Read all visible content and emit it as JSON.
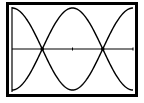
{
  "chart_data": {
    "type": "line",
    "title": "",
    "xlabel": "",
    "ylabel": "",
    "xlim": [
      0,
      6.2832
    ],
    "ylim": [
      -1,
      1
    ],
    "grid": false,
    "legend": null,
    "x": [
      0,
      0.7854,
      1.5708,
      2.3562,
      3.1416,
      3.927,
      4.7124,
      5.4978,
      6.2832
    ],
    "series": [
      {
        "name": "cos(x)",
        "values": [
          1,
          0.707,
          0,
          -0.707,
          -1,
          -0.707,
          0,
          0.707,
          1
        ]
      },
      {
        "name": "-cos(x)",
        "values": [
          -1,
          -0.707,
          0,
          0.707,
          1,
          0.707,
          0,
          -0.707,
          -1
        ]
      }
    ],
    "intersections": [
      {
        "x": 1.5708,
        "y": 0
      },
      {
        "x": 4.7124,
        "y": 0
      }
    ],
    "x_axis_ticks": [
      3.1416,
      6.2832
    ]
  },
  "colors": {
    "background": "#ffffff",
    "ink": "#000000"
  }
}
